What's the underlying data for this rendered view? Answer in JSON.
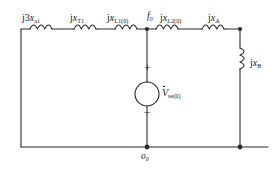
{
  "figure": {
    "ink_color": "#2b2b2b",
    "label_color": "#1a1a1a"
  },
  "series_elements": [
    {
      "name": "series-inductor-1",
      "label_prefix": "j3",
      "symbol": "x",
      "subscript": "a1",
      "x": 22,
      "y": 13
    },
    {
      "name": "series-inductor-2",
      "label_prefix": "j",
      "symbol": "x",
      "subscript": "T1",
      "x": 70,
      "y": 13
    },
    {
      "name": "series-inductor-3",
      "label_prefix": "j",
      "symbol": "x",
      "subscript": "L1(0)",
      "x": 107,
      "y": 13
    },
    {
      "name": "series-inductor-4",
      "label_prefix": "j",
      "symbol": "x",
      "subscript": "L2(0)",
      "x": 160,
      "y": 13
    },
    {
      "name": "series-inductor-5",
      "label_prefix": "j",
      "symbol": "x",
      "subscript": "A",
      "x": 208,
      "y": 13
    }
  ],
  "shunt_element": {
    "name": "shunt-inductor-b",
    "label_prefix": "j",
    "symbol": "x",
    "subscript": "B",
    "x": 250,
    "y": 58
  },
  "source": {
    "name": "voltage-source-se0",
    "symbol": "V",
    "subscript": "se(0)",
    "plus_sign": "+",
    "minus_sign": "−",
    "label_x": 176,
    "label_y": 87,
    "plus_x": 178,
    "plus_y": 68,
    "minus_x": 178,
    "minus_y": 108
  },
  "nodes": [
    {
      "name": "node-f0",
      "label": "f",
      "subscript": "0",
      "x": 147,
      "y": 12
    },
    {
      "name": "node-o0",
      "label": "o",
      "subscript": "0",
      "x": 148,
      "y": 152
    }
  ]
}
